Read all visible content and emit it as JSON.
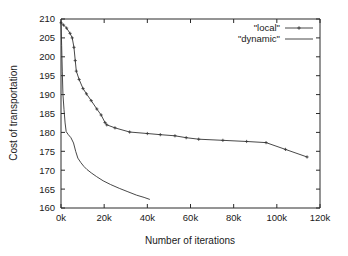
{
  "chart_data": {
    "type": "line",
    "title": "",
    "xlabel": "Number of iterations",
    "ylabel": "Cost of transportation",
    "xlim": [
      0,
      120000
    ],
    "ylim": [
      160,
      210
    ],
    "grid": false,
    "legend_position": "top-right-inside",
    "x_tick_labels": [
      "0k",
      "20k",
      "40k",
      "60k",
      "80k",
      "100k",
      "120k"
    ],
    "x_tick_values": [
      0,
      20000,
      40000,
      60000,
      80000,
      100000,
      120000
    ],
    "y_tick_labels": [
      "160",
      "165",
      "170",
      "175",
      "180",
      "185",
      "190",
      "195",
      "200",
      "205",
      "210"
    ],
    "y_tick_values": [
      160,
      165,
      170,
      175,
      180,
      185,
      190,
      195,
      200,
      205,
      210
    ],
    "series": [
      {
        "name": "\"local\"",
        "has_markers": true,
        "marker": "cross",
        "points": [
          [
            0,
            209.0
          ],
          [
            1200,
            208.4
          ],
          [
            2600,
            207.6
          ],
          [
            4200,
            206.2
          ],
          [
            5200,
            205.0
          ],
          [
            6000,
            202.5
          ],
          [
            6600,
            199.0
          ],
          [
            7100,
            196.2
          ],
          [
            8400,
            194.0
          ],
          [
            10200,
            191.6
          ],
          [
            11800,
            190.2
          ],
          [
            14000,
            188.4
          ],
          [
            16600,
            186.2
          ],
          [
            18600,
            184.6
          ],
          [
            20400,
            182.6
          ],
          [
            21200,
            182.0
          ],
          [
            25000,
            181.2
          ],
          [
            31800,
            180.1
          ],
          [
            40000,
            179.7
          ],
          [
            46000,
            179.4
          ],
          [
            52800,
            179.1
          ],
          [
            58000,
            178.6
          ],
          [
            63800,
            178.2
          ],
          [
            75000,
            177.9
          ],
          [
            86000,
            177.6
          ],
          [
            95000,
            177.3
          ],
          [
            104000,
            175.5
          ],
          [
            114000,
            173.5
          ]
        ]
      },
      {
        "name": "\"dynamic\"",
        "has_markers": false,
        "marker": "none",
        "points": [
          [
            0,
            209.0
          ],
          [
            300,
            203.0
          ],
          [
            600,
            196.0
          ],
          [
            900,
            190.0
          ],
          [
            1400,
            186.0
          ],
          [
            1900,
            182.5
          ],
          [
            2400,
            180.2
          ],
          [
            3400,
            179.4
          ],
          [
            4600,
            178.6
          ],
          [
            5800,
            177.2
          ],
          [
            6800,
            175.0
          ],
          [
            7800,
            173.2
          ],
          [
            9200,
            172.0
          ],
          [
            10600,
            171.0
          ],
          [
            12000,
            170.2
          ],
          [
            14000,
            169.3
          ],
          [
            16500,
            168.3
          ],
          [
            19500,
            167.2
          ],
          [
            23000,
            166.2
          ],
          [
            27000,
            165.2
          ],
          [
            31000,
            164.3
          ],
          [
            35000,
            163.4
          ],
          [
            38500,
            162.8
          ],
          [
            41000,
            162.3
          ]
        ]
      }
    ]
  }
}
